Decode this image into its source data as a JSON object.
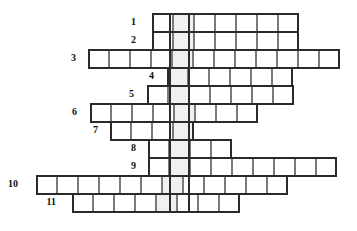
{
  "puzzle": {
    "title": "Crossword Grid",
    "type": "crossword-skeleton",
    "grid": {
      "cell_size": 21,
      "origin_x": 0,
      "origin_y": 13,
      "row_height": 18,
      "total_rows": 11,
      "key_column_shaded": true,
      "key_column_x": 169,
      "key_column_width": 21,
      "cell_border_color": "#7a7a7a",
      "row_border_color": "#2b2b2b",
      "shaded_cell_color": "#f0f0f0",
      "background_color": "#ffffff"
    },
    "rows": [
      {
        "number": "1",
        "cells": 7,
        "start_x": 152,
        "y": 13,
        "shaded_index": 1,
        "label_x": 132,
        "label_y": 19
      },
      {
        "number": "2",
        "cells": 7,
        "start_x": 152,
        "y": 31,
        "shaded_index": 1,
        "label_x": 132,
        "label_y": 37
      },
      {
        "number": "3",
        "cells": 12,
        "start_x": 88,
        "y": 49,
        "shaded_index": 4,
        "label_x": 72,
        "label_y": 55
      },
      {
        "number": "4",
        "cells": 6,
        "start_x": 167,
        "y": 67,
        "shaded_index": 0,
        "label_x": 150,
        "label_y": 73
      },
      {
        "number": "5",
        "cells": 7,
        "start_x": 147,
        "y": 85,
        "shaded_index": 1,
        "label_x": 130,
        "label_y": 91
      },
      {
        "number": "6",
        "cells": 8,
        "start_x": 90,
        "y": 103,
        "shaded_index": 4,
        "label_x": 73,
        "label_y": 109
      },
      {
        "number": "7",
        "cells": 4,
        "start_x": 110,
        "y": 121,
        "shaded_index": 3,
        "label_x": 94,
        "label_y": 127
      },
      {
        "number": "8",
        "cells": 4,
        "start_x": 148,
        "y": 139,
        "shaded_index": 1,
        "label_x": 132,
        "label_y": 145
      },
      {
        "number": "9",
        "cells": 9,
        "start_x": 148,
        "y": 157,
        "shaded_index": 1,
        "label_x": 132,
        "label_y": 163
      },
      {
        "number": "10",
        "cells": 12,
        "start_x": 36,
        "y": 175,
        "shaded_index": 6,
        "label_x": 14,
        "label_y": 181
      },
      {
        "number": "11",
        "cells": 8,
        "start_x": 72,
        "y": 193,
        "shaded_index": 4,
        "label_x": 52,
        "label_y": 199
      }
    ]
  }
}
